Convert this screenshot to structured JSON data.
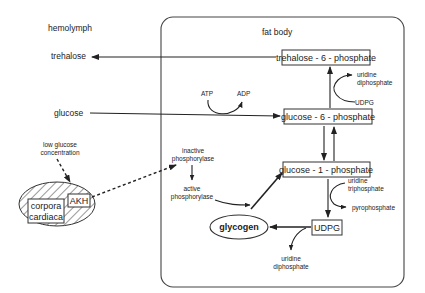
{
  "regions": {
    "hemolymph": "hemolymph",
    "fat_body": "fat body"
  },
  "hemolymph": {
    "trehalose": "trehalose",
    "glucose": "glucose",
    "stimulus": [
      "low glucose",
      "concentration"
    ],
    "gland": [
      "corpora",
      "cardiaca"
    ],
    "hormone": "AKH"
  },
  "fat_body": {
    "trehalose_6_phosphate": "trehalose - 6 - phosphate",
    "glucose_6_phosphate": "glucose - 6 - phosphate",
    "glucose_1_phosphate": "glucose - 1 - phosphate",
    "udpg_box": "UDPG",
    "glycogen": "glycogen",
    "atp": "ATP",
    "adp": "ADP",
    "udp_top": [
      "uridine",
      "diphosphate"
    ],
    "udpg_in": "UDPG",
    "utp": [
      "uridine",
      "triphosphate"
    ],
    "pyrophosphate": "pyrophosphate",
    "udp_bottom": [
      "uridine",
      "diphosphate"
    ],
    "inactive_phosphorylase": [
      "inactive",
      "phosphorylase"
    ],
    "active_phosphorylase": [
      "active",
      "phosphorylase"
    ]
  }
}
